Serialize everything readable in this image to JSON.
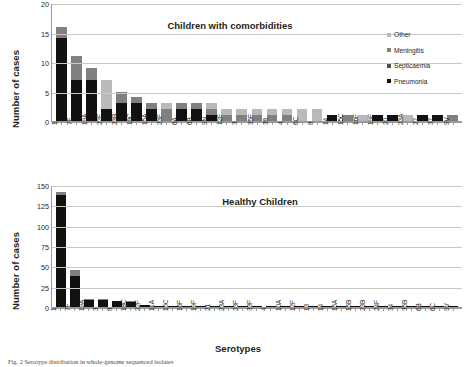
{
  "figure": {
    "caption": "Fig. 2  Serotype distribution in whole-genome sequenced isolates"
  },
  "legend": {
    "position": "top-right",
    "entries": [
      {
        "label": "Other",
        "color": "#b9b9b9"
      },
      {
        "label": "Meningitis",
        "color": "#808080"
      },
      {
        "label": "Septicaemia",
        "color": "#4d4d4d"
      },
      {
        "label": "Pneumonia",
        "color": "#111111"
      }
    ]
  },
  "chart_data": [
    {
      "type": "bar",
      "stacked": true,
      "title": "Children with comorbidities",
      "xlabel": "",
      "ylabel": "Number of cases",
      "ylim": [
        0,
        20
      ],
      "yticks": [
        20,
        15,
        10,
        5,
        0
      ],
      "grid": true,
      "categories": [
        "1",
        "7F",
        "19A",
        "22F",
        "23B",
        "18C",
        "15A",
        "23F",
        "6A",
        "6B",
        "9N",
        "12F",
        "3",
        "35F",
        "38",
        "4",
        "6C",
        "8",
        "14",
        "15C",
        "16F",
        "19F",
        "20",
        "23A",
        "27",
        "37",
        "9V"
      ],
      "series": [
        {
          "name": "Pneumonia",
          "color": "#111111",
          "values": [
            14,
            7,
            7,
            2,
            3,
            3,
            2,
            0,
            2,
            2,
            1,
            0,
            0,
            0,
            0,
            0,
            0,
            0,
            1,
            0,
            0,
            1,
            1,
            0,
            1,
            1,
            0
          ]
        },
        {
          "name": "Septicaemia",
          "color": "#4d4d4d",
          "values": [
            0,
            0,
            0,
            0,
            0,
            0,
            0,
            0,
            0,
            0,
            0,
            0,
            0,
            0,
            0,
            0,
            0,
            0,
            0,
            0,
            0,
            0,
            0,
            0,
            0,
            0,
            0
          ]
        },
        {
          "name": "Meningitis",
          "color": "#808080",
          "values": [
            2,
            4,
            2,
            0,
            2,
            1,
            1,
            2,
            1,
            1,
            1,
            1,
            1,
            1,
            1,
            1,
            0,
            0,
            0,
            1,
            0,
            0,
            0,
            0,
            0,
            0,
            1
          ]
        },
        {
          "name": "Other",
          "color": "#b9b9b9",
          "values": [
            0,
            0,
            0,
            5,
            0,
            0,
            0,
            1,
            0,
            0,
            1,
            1,
            1,
            1,
            1,
            1,
            2,
            2,
            0,
            0,
            1,
            0,
            0,
            1,
            0,
            0,
            0
          ]
        }
      ],
      "totals": [
        16,
        11,
        9,
        7,
        5,
        4,
        3,
        3,
        3,
        3,
        3,
        2,
        2,
        2,
        2,
        2,
        2,
        2,
        1,
        1,
        1,
        1,
        1,
        1,
        1,
        1,
        1
      ]
    },
    {
      "type": "bar",
      "stacked": true,
      "title": "Healthy Children",
      "xlabel": "Serotypes",
      "ylabel": "Number of cases",
      "ylim": [
        0,
        150
      ],
      "yticks": [
        150,
        125,
        100,
        75,
        50,
        25,
        0
      ],
      "grid": true,
      "categories": [
        "1",
        "7F",
        "19A",
        "3",
        "8",
        "18C",
        "22F",
        "11A",
        "15C",
        "16F",
        "19F",
        "21",
        "23A",
        "23F",
        "33F",
        "4",
        "10A",
        "12F",
        "13",
        "14",
        "15A",
        "15B",
        "23B",
        "24F",
        "34",
        "35B",
        "6B",
        "6C",
        "9V"
      ],
      "series": [
        {
          "name": "Pneumonia",
          "color": "#111111",
          "values": [
            138,
            38,
            9,
            9,
            8,
            6,
            3,
            1,
            1,
            1,
            1,
            1,
            1,
            1,
            1,
            1,
            1,
            1,
            1,
            1,
            1,
            1,
            1,
            1,
            1,
            1,
            1,
            1,
            1
          ]
        },
        {
          "name": "Septicaemia",
          "color": "#4d4d4d",
          "values": [
            0,
            0,
            0,
            0,
            0,
            0,
            0,
            0,
            0,
            0,
            0,
            0,
            0,
            0,
            0,
            0,
            0,
            0,
            0,
            0,
            0,
            0,
            0,
            0,
            0,
            0,
            0,
            0,
            0
          ]
        },
        {
          "name": "Meningitis",
          "color": "#808080",
          "values": [
            4,
            7,
            1,
            1,
            0,
            1,
            0,
            0,
            0,
            0,
            0,
            0,
            0,
            0,
            0,
            0,
            0,
            0,
            0,
            0,
            0,
            0,
            0,
            0,
            0,
            0,
            0,
            0,
            0
          ]
        },
        {
          "name": "Other",
          "color": "#b9b9b9",
          "values": [
            0,
            0,
            0,
            0,
            0,
            0,
            0,
            0,
            0,
            0,
            0,
            0,
            0,
            0,
            0,
            0,
            0,
            0,
            0,
            0,
            0,
            0,
            0,
            0,
            0,
            0,
            0,
            0,
            0
          ]
        }
      ],
      "totals": [
        142,
        45,
        10,
        10,
        8,
        7,
        3,
        1,
        1,
        1,
        1,
        1,
        1,
        1,
        1,
        1,
        1,
        1,
        1,
        1,
        1,
        1,
        1,
        1,
        1,
        1,
        1,
        1,
        1
      ]
    }
  ]
}
